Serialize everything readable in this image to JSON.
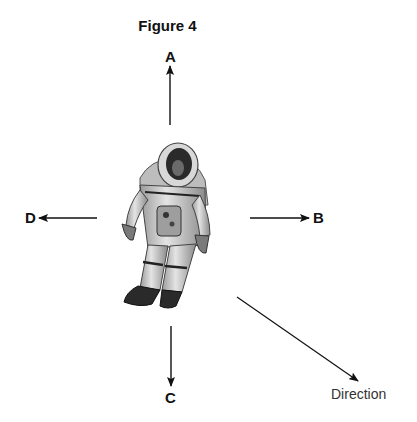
{
  "figure": {
    "title": "Figure 4",
    "arrows": [
      {
        "id": "A",
        "label": "A",
        "direction": "up"
      },
      {
        "id": "B",
        "label": "B",
        "direction": "right"
      },
      {
        "id": "C",
        "label": "C",
        "direction": "down"
      },
      {
        "id": "D",
        "label": "D",
        "direction": "left"
      }
    ],
    "direction_arrow": {
      "label": "Direction",
      "orientation": "down-right"
    }
  }
}
